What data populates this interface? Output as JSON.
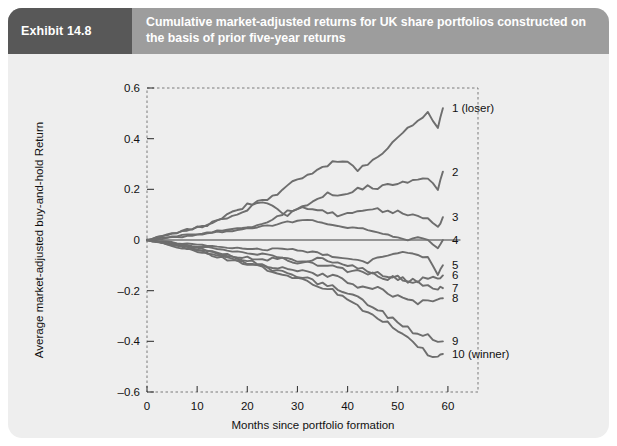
{
  "exhibit": {
    "tag": "Exhibit 14.8",
    "title": "Cumulative market-adjusted returns for UK share portfolios constructed on the basis of prior five-year returns"
  },
  "chart_data": {
    "type": "line",
    "title": "Cumulative market-adjusted returns for UK share portfolios constructed on the basis of prior five-year returns",
    "xlabel": "Months since portfolio formation",
    "ylabel": "Average market-adjusted buy-and-hold Return",
    "xlim": [
      0,
      66
    ],
    "ylim": [
      -0.6,
      0.6
    ],
    "xticks": [
      0,
      10,
      20,
      30,
      40,
      50,
      60
    ],
    "xticklabels": [
      "0",
      "10",
      "20",
      "30",
      "40",
      "50",
      "60"
    ],
    "yticks": [
      0.6,
      0.4,
      0.2,
      0,
      -0.2,
      -0.4,
      -0.6
    ],
    "yticklabels": [
      "0.6",
      "0.4",
      "0.2",
      "0",
      "–0.2",
      "–0.4",
      "–0.6"
    ],
    "grid": false,
    "legend_position": "right-inline-labels",
    "zero_reference_line": 0,
    "line_color": "#6e6e6e",
    "border_style": "dashed",
    "x": [
      0,
      2,
      4,
      6,
      8,
      10,
      12,
      14,
      16,
      18,
      20,
      22,
      24,
      26,
      28,
      30,
      32,
      34,
      36,
      38,
      40,
      42,
      44,
      46,
      48,
      50,
      52,
      54,
      56,
      58,
      59
    ],
    "series": [
      {
        "name": "1 (loser)",
        "label": "1 (loser)",
        "end_value": 0.52,
        "values": [
          0,
          0.01,
          0.02,
          0.03,
          0.04,
          0.05,
          0.06,
          0.08,
          0.1,
          0.12,
          0.14,
          0.15,
          0.16,
          0.18,
          0.21,
          0.24,
          0.25,
          0.27,
          0.3,
          0.31,
          0.3,
          0.28,
          0.3,
          0.33,
          0.37,
          0.41,
          0.44,
          0.47,
          0.5,
          0.44,
          0.52
        ]
      },
      {
        "name": "2",
        "label": "2",
        "end_value": 0.27,
        "values": [
          0,
          0.01,
          0.02,
          0.03,
          0.04,
          0.05,
          0.06,
          0.08,
          0.09,
          0.1,
          0.12,
          0.14,
          0.14,
          0.12,
          0.1,
          0.12,
          0.14,
          0.16,
          0.18,
          0.17,
          0.18,
          0.2,
          0.21,
          0.2,
          0.22,
          0.23,
          0.22,
          0.24,
          0.25,
          0.2,
          0.27
        ]
      },
      {
        "name": "3",
        "label": "3",
        "end_value": 0.09,
        "values": [
          0,
          0.005,
          0.01,
          0.015,
          0.02,
          0.025,
          0.03,
          0.035,
          0.04,
          0.045,
          0.05,
          0.06,
          0.07,
          0.09,
          0.11,
          0.12,
          0.13,
          0.12,
          0.11,
          0.1,
          0.1,
          0.11,
          0.12,
          0.12,
          0.11,
          0.11,
          0.1,
          0.09,
          0.08,
          0.05,
          0.09
        ]
      },
      {
        "name": "4",
        "label": "4",
        "end_value": 0.0,
        "values": [
          0,
          0.004,
          0.008,
          0.012,
          0.015,
          0.02,
          0.025,
          0.03,
          0.035,
          0.04,
          0.045,
          0.05,
          0.055,
          0.06,
          0.07,
          0.08,
          0.08,
          0.07,
          0.06,
          0.055,
          0.05,
          0.05,
          0.04,
          0.03,
          0.02,
          0.01,
          0.0,
          0.01,
          0.0,
          -0.03,
          0.0
        ]
      },
      {
        "name": "5",
        "label": "5",
        "end_value": -0.1,
        "values": [
          0,
          -0.004,
          -0.008,
          -0.012,
          -0.015,
          -0.02,
          -0.022,
          -0.025,
          -0.028,
          -0.03,
          -0.033,
          -0.035,
          -0.04,
          -0.03,
          -0.035,
          -0.04,
          -0.045,
          -0.05,
          -0.06,
          -0.065,
          -0.07,
          -0.08,
          -0.09,
          -0.07,
          -0.06,
          -0.05,
          -0.05,
          -0.06,
          -0.07,
          -0.14,
          -0.1
        ]
      },
      {
        "name": "6",
        "label": "6",
        "end_value": -0.14,
        "values": [
          0,
          -0.005,
          -0.01,
          -0.015,
          -0.02,
          -0.025,
          -0.03,
          -0.035,
          -0.04,
          -0.045,
          -0.05,
          -0.055,
          -0.06,
          -0.065,
          -0.07,
          -0.08,
          -0.09,
          -0.1,
          -0.1,
          -0.11,
          -0.12,
          -0.12,
          -0.13,
          -0.14,
          -0.15,
          -0.15,
          -0.16,
          -0.16,
          -0.15,
          -0.15,
          -0.14
        ]
      },
      {
        "name": "7",
        "label": "7",
        "end_value": -0.19,
        "values": [
          0,
          -0.006,
          -0.012,
          -0.018,
          -0.024,
          -0.03,
          -0.04,
          -0.05,
          -0.06,
          -0.065,
          -0.07,
          -0.08,
          -0.08,
          -0.07,
          -0.08,
          -0.09,
          -0.08,
          -0.07,
          -0.08,
          -0.09,
          -0.1,
          -0.11,
          -0.12,
          -0.13,
          -0.14,
          -0.15,
          -0.16,
          -0.17,
          -0.18,
          -0.19,
          -0.19
        ]
      },
      {
        "name": "8",
        "label": "8",
        "end_value": -0.23,
        "values": [
          0,
          -0.007,
          -0.014,
          -0.02,
          -0.027,
          -0.035,
          -0.045,
          -0.055,
          -0.065,
          -0.075,
          -0.085,
          -0.09,
          -0.1,
          -0.11,
          -0.11,
          -0.12,
          -0.13,
          -0.14,
          -0.14,
          -0.15,
          -0.17,
          -0.19,
          -0.18,
          -0.19,
          -0.21,
          -0.22,
          -0.24,
          -0.25,
          -0.23,
          -0.24,
          -0.23
        ]
      },
      {
        "name": "9",
        "label": "9",
        "end_value": -0.4,
        "values": [
          0,
          -0.008,
          -0.016,
          -0.024,
          -0.032,
          -0.04,
          -0.05,
          -0.06,
          -0.07,
          -0.08,
          -0.09,
          -0.1,
          -0.11,
          -0.12,
          -0.13,
          -0.14,
          -0.15,
          -0.17,
          -0.18,
          -0.19,
          -0.21,
          -0.23,
          -0.25,
          -0.27,
          -0.3,
          -0.32,
          -0.35,
          -0.37,
          -0.38,
          -0.4,
          -0.4
        ]
      },
      {
        "name": "10 (winner)",
        "label": "10 (winner)",
        "end_value": -0.45,
        "values": [
          0,
          -0.009,
          -0.018,
          -0.027,
          -0.036,
          -0.045,
          -0.055,
          -0.065,
          -0.075,
          -0.085,
          -0.095,
          -0.105,
          -0.115,
          -0.125,
          -0.14,
          -0.15,
          -0.16,
          -0.18,
          -0.19,
          -0.21,
          -0.23,
          -0.26,
          -0.29,
          -0.31,
          -0.33,
          -0.36,
          -0.39,
          -0.42,
          -0.45,
          -0.46,
          -0.45
        ]
      }
    ]
  }
}
